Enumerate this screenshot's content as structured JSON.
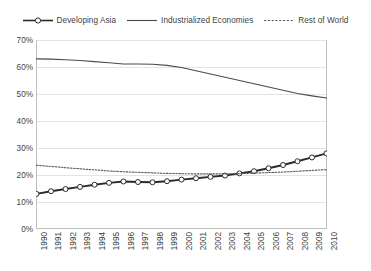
{
  "chart_data": {
    "type": "line",
    "title": "",
    "subtitle": "",
    "xlabel": "",
    "ylabel": "",
    "x": [
      1990,
      1991,
      1992,
      1993,
      1994,
      1995,
      1996,
      1997,
      1998,
      1999,
      2000,
      2001,
      2002,
      2003,
      2004,
      2005,
      2006,
      2007,
      2008,
      2009,
      2010
    ],
    "categories": [
      "1990",
      "1991",
      "1992",
      "1993",
      "1994",
      "1995",
      "1996",
      "1997",
      "1998",
      "1999",
      "2000",
      "2001",
      "2002",
      "2003",
      "2004",
      "2005",
      "2006",
      "2007",
      "2008",
      "2009",
      "2010"
    ],
    "ylim": [
      0,
      70
    ],
    "ytick_values": [
      0,
      10,
      20,
      30,
      40,
      50,
      60,
      70
    ],
    "ytick_labels": [
      "0%",
      "10%",
      "20%",
      "30%",
      "40%",
      "50%",
      "60%",
      "70%"
    ],
    "grid": "horizontal",
    "legend_position": "top",
    "series": [
      {
        "name": "Developing Asia",
        "style": "solid-with-markers",
        "marker": "open-circle",
        "color": "#2b2b2b",
        "values": [
          13.0,
          14.0,
          14.8,
          15.6,
          16.4,
          17.1,
          17.6,
          17.4,
          17.3,
          17.7,
          18.3,
          18.8,
          19.3,
          19.8,
          20.6,
          21.4,
          22.5,
          23.7,
          25.1,
          26.5,
          28.0
        ]
      },
      {
        "name": "Industrialized Economies",
        "style": "solid",
        "marker": "none",
        "color": "#4a4a4a",
        "values": [
          63.0,
          62.9,
          62.7,
          62.4,
          62.0,
          61.6,
          61.1,
          61.1,
          61.0,
          60.6,
          59.8,
          58.6,
          57.4,
          56.2,
          55.0,
          53.8,
          52.6,
          51.4,
          50.2,
          49.3,
          48.5
        ]
      },
      {
        "name": "Rest of World",
        "style": "dotted",
        "marker": "none",
        "color": "#5a5a5a",
        "values": [
          23.6,
          23.2,
          22.7,
          22.3,
          21.9,
          21.5,
          21.2,
          21.0,
          20.8,
          20.6,
          20.5,
          20.4,
          20.4,
          20.4,
          20.5,
          20.7,
          20.9,
          21.1,
          21.4,
          21.7,
          22.0
        ]
      }
    ]
  },
  "legend": {
    "items": [
      {
        "label": "Developing Asia",
        "key": "line-open-circle-marker"
      },
      {
        "label": "Industrialized Economies",
        "key": "line-solid"
      },
      {
        "label": "Rest of World",
        "key": "line-dotted"
      }
    ]
  },
  "colors": {
    "gridline": "#e3e3e3",
    "axis": "#bfbfbf",
    "text": "#3f3f3f",
    "series_developing_asia": "#2b2b2b",
    "series_industrialized": "#4a4a4a",
    "series_rest_of_world": "#5a5a5a",
    "background": "#ffffff"
  }
}
